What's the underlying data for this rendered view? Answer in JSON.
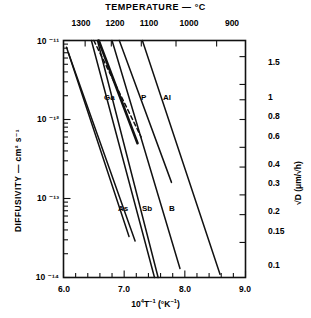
{
  "figure": {
    "top_axis_title": "TEMPERATURE — °C",
    "left_axis_title": "DIFFUSIVITY — cm² s⁻¹",
    "right_axis_title": "√D (μm/√h)",
    "bottom_axis_title_html": "10⁴T⁻¹ (°K⁻¹)"
  },
  "top_ticks": [
    {
      "label": "1300",
      "value": 1300
    },
    {
      "label": "1200",
      "value": 1200
    },
    {
      "label": "1100",
      "value": 1100
    },
    {
      "label": "1000",
      "value": 1000
    },
    {
      "label": "900",
      "value": 900
    }
  ],
  "left_ticks": [
    {
      "label": "10 ⁻¹¹",
      "value": 1e-11
    },
    {
      "label": "10 ⁻¹²",
      "value": 1e-12
    },
    {
      "label": "10 ⁻¹³",
      "value": 1e-13
    },
    {
      "label": "10 ⁻¹⁴",
      "value": 1e-14
    }
  ],
  "right_ticks": [
    {
      "label": "1.5",
      "value": 1.5
    },
    {
      "label": "1",
      "value": 1.0
    },
    {
      "label": "0.8",
      "value": 0.8
    },
    {
      "label": "0.6",
      "value": 0.6
    },
    {
      "label": "0.4",
      "value": 0.4
    },
    {
      "label": "0.3",
      "value": 0.3
    },
    {
      "label": "0.2",
      "value": 0.2
    },
    {
      "label": "0.15",
      "value": 0.15
    },
    {
      "label": "0.1",
      "value": 0.1
    }
  ],
  "bottom_ticks": [
    {
      "label": "6.0",
      "value": 6.0
    },
    {
      "label": "7.0",
      "value": 7.0
    },
    {
      "label": "8.0",
      "value": 8.0
    },
    {
      "label": "9.0",
      "value": 9.0
    }
  ],
  "curve_labels": [
    {
      "name": "Ga",
      "text": "Ga"
    },
    {
      "name": "P",
      "text": "P"
    },
    {
      "name": "Al",
      "text": "Al"
    },
    {
      "name": "As",
      "text": "As"
    },
    {
      "name": "Sb",
      "text": "Sb"
    },
    {
      "name": "B",
      "text": "B"
    }
  ],
  "chart_data": {
    "type": "line",
    "title": "TEMPERATURE — °C",
    "xlabel": "10⁴T⁻¹ (°K⁻¹)",
    "ylabel": "DIFFUSIVITY — cm² s⁻¹",
    "y2label": "√D (μm/√h)",
    "xlim": [
      6.0,
      9.0
    ],
    "ylim": [
      1e-14,
      1e-11
    ],
    "y_scale": "log",
    "x_ticks": [
      6.0,
      7.0,
      8.0,
      9.0
    ],
    "x_minor_tick_step": 0.2,
    "y_ticks": [
      1e-14,
      1e-13,
      1e-12,
      1e-11
    ],
    "y2_ticks": [
      0.1,
      0.15,
      0.2,
      0.3,
      0.4,
      0.6,
      0.8,
      1.0,
      1.5
    ],
    "top_axis_ticks_celsius": [
      1300,
      1200,
      1100,
      1000,
      900
    ],
    "grid": false,
    "legend": "inline-curve-labels",
    "note": "Arrhenius plot of dopant diffusivity in silicon; straight lines on a log-D vs 1/T plot.",
    "series": [
      {
        "name": "Au",
        "label": "",
        "style": "solid",
        "x": [
          6.05,
          7.08
        ],
        "y": [
          8.2e-12,
          3.3e-14
        ]
      },
      {
        "name": "Au2",
        "label": "",
        "style": "solid",
        "x": [
          6.08,
          7.18
        ],
        "y": [
          7e-12,
          2.9e-14
        ]
      },
      {
        "name": "dashed-unlabeled",
        "label": "",
        "style": "dashed",
        "x": [
          6.5,
          7.28
        ],
        "y": [
          1e-11,
          6e-13
        ]
      },
      {
        "name": "As",
        "label": "As",
        "style": "solid",
        "x": [
          6.46,
          7.5
        ],
        "y": [
          1e-11,
          1e-14
        ]
      },
      {
        "name": "Sb",
        "label": "Sb",
        "style": "solid",
        "x": [
          6.56,
          7.56
        ],
        "y": [
          1e-11,
          1e-14
        ]
      },
      {
        "name": "Ga",
        "label": "Ga",
        "style": "solid-bold",
        "x": [
          6.58,
          7.22
        ],
        "y": [
          1e-11,
          5e-13
        ]
      },
      {
        "name": "B",
        "label": "B",
        "style": "solid",
        "x": [
          6.8,
          7.92
        ],
        "y": [
          1e-11,
          1.3e-14
        ]
      },
      {
        "name": "P",
        "label": "P",
        "style": "solid",
        "x": [
          6.92,
          7.78
        ],
        "y": [
          1e-11,
          1.6e-13
        ]
      },
      {
        "name": "Al",
        "label": "Al",
        "style": "solid",
        "x": [
          7.3,
          8.58
        ],
        "y": [
          1e-11,
          1.1e-14
        ]
      }
    ]
  }
}
